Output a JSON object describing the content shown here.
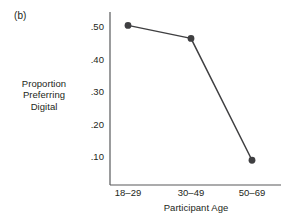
{
  "figure": {
    "panel_label": "(b)",
    "background_color": "#ffffff",
    "ink_color": "#231f20",
    "axis_color": "#58595b"
  },
  "chart_data": {
    "type": "line",
    "title": "",
    "subtitle": "",
    "xlabel": "Participant Age",
    "ylabel": "Proportion Preferring Digital",
    "ylabel_lines": [
      "Proportion",
      "Preferring",
      "Digital"
    ],
    "categories": [
      "18–29",
      "30–49",
      "50–69"
    ],
    "values": [
      0.505,
      0.465,
      0.09
    ],
    "series": [
      {
        "name": "Proportion Preferring Digital",
        "values": [
          0.505,
          0.465,
          0.09
        ],
        "color": "#3f3f41",
        "marker": "filled-circle"
      }
    ],
    "ylim": [
      0.0,
      0.55
    ],
    "yticks": [
      0.5,
      0.4,
      0.3,
      0.2,
      0.1
    ],
    "ytick_labels": [
      ".50",
      ".40",
      ".30",
      ".20",
      ".10"
    ],
    "grid": false,
    "legend": null,
    "legend_position": "none",
    "annotations": [
      "(b)"
    ]
  },
  "geometry": {
    "axis_left_x": 110,
    "axis_bottom_y": 185,
    "axis_top_y": 12,
    "axis_right_x": 281,
    "tick_y_positions": [
      27,
      59.5,
      92,
      124.5,
      157
    ],
    "point_x_positions": [
      128,
      191,
      252
    ],
    "point_y_positions": [
      25,
      38,
      161
    ],
    "marker_radius": 3.4
  }
}
